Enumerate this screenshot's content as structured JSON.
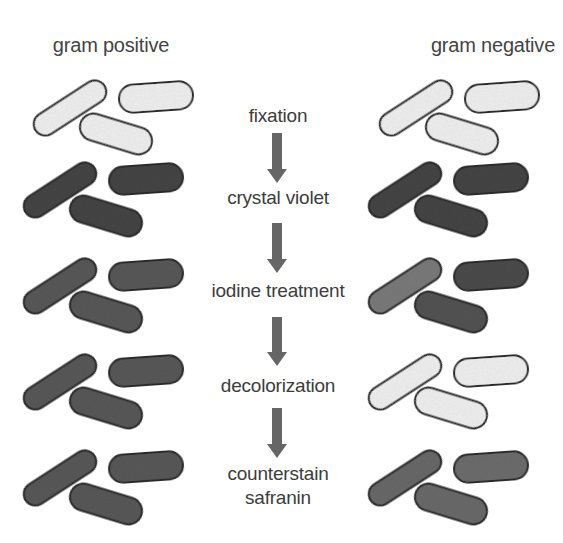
{
  "diagram": {
    "title_left": "gram positive",
    "title_right": "gram negative",
    "colors": {
      "unstained_fill": "#f3f3f3",
      "crystal_violet_fill": "#4a4a4a",
      "iodine_fill": "#5a5a5a",
      "iodine_light_fill": "#7c7c7c",
      "safranin_fill": "#6a6a6a",
      "outline": "#2e2e2e",
      "arrow": "#666666",
      "text": "#3c3c3c"
    },
    "steps": [
      {
        "label": "fixation",
        "label_y": 104
      },
      {
        "label": "crystal violet",
        "label_y": 186
      },
      {
        "label": "iodine treatment",
        "label_y": 279
      },
      {
        "label": "decolorization",
        "label_y": 374
      },
      {
        "label": "counterstain",
        "label2": "safranin",
        "label_y": 462
      }
    ],
    "arrows": [
      {
        "from_step": "fixation",
        "to_step": "crystal violet",
        "y1": 133,
        "y2": 183
      },
      {
        "from_step": "crystal violet",
        "to_step": "iodine treatment",
        "y1": 223,
        "y2": 273
      },
      {
        "from_step": "iodine treatment",
        "to_step": "decolorization",
        "y1": 317,
        "y2": 366
      },
      {
        "from_step": "decolorization",
        "to_step": "counterstain safranin",
        "y1": 408,
        "y2": 458
      }
    ],
    "gram_positive": {
      "rows": [
        {
          "step": "fixation",
          "state": "unstained",
          "dx": 10,
          "dy": -82,
          "fills": [
            "#f3f3f3",
            "#f3f3f3",
            "#f3f3f3"
          ]
        },
        {
          "step": "crystal violet",
          "state": "purple",
          "dx": 0,
          "dy": 0,
          "fills": [
            "#464646",
            "#464646",
            "#464646"
          ]
        },
        {
          "step": "iodine treatment",
          "state": "purple",
          "dx": 0,
          "dy": 96,
          "fills": [
            "#5a5a5a",
            "#5a5a5a",
            "#5a5a5a"
          ]
        },
        {
          "step": "decolorization",
          "state": "purple",
          "dx": 0,
          "dy": 192,
          "fills": [
            "#5a5a5a",
            "#5a5a5a",
            "#5a5a5a"
          ]
        },
        {
          "step": "counterstain safranin",
          "state": "purple",
          "dx": 0,
          "dy": 288,
          "fills": [
            "#5a5a5a",
            "#5a5a5a",
            "#5a5a5a"
          ]
        }
      ]
    },
    "gram_negative": {
      "rows": [
        {
          "step": "fixation",
          "state": "unstained",
          "dx": 356,
          "dy": -82,
          "fills": [
            "#f3f3f3",
            "#f3f3f3",
            "#f3f3f3"
          ]
        },
        {
          "step": "crystal violet",
          "state": "purple",
          "dx": 345,
          "dy": 0,
          "fills": [
            "#464646",
            "#464646",
            "#464646"
          ]
        },
        {
          "step": "iodine treatment",
          "state": "purple",
          "dx": 345,
          "dy": 96,
          "fills": [
            "#7c7c7c",
            "#4e4e4e",
            "#555555"
          ]
        },
        {
          "step": "decolorization",
          "state": "colorless",
          "dx": 345,
          "dy": 192,
          "fills": [
            "#f3f3f3",
            "#f3f3f3",
            "#f3f3f3"
          ]
        },
        {
          "step": "counterstain safranin",
          "state": "pink",
          "dx": 345,
          "dy": 288,
          "fills": [
            "#6a6a6a",
            "#6e6e6e",
            "#6c6c6c"
          ]
        }
      ]
    },
    "rod_layout": [
      {
        "cx": 60,
        "cy": 190,
        "len": 82,
        "thick": 23,
        "angle": -33
      },
      {
        "cx": 146,
        "cy": 179,
        "len": 74,
        "thick": 28,
        "angle": -4
      },
      {
        "cx": 106,
        "cy": 216,
        "len": 74,
        "thick": 27,
        "angle": 17
      }
    ]
  }
}
